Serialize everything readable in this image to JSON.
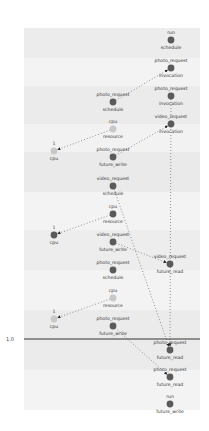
{
  "diagram": {
    "axis": {
      "label": "1.0",
      "y": 339
    },
    "bands": [
      {
        "y": 28,
        "h": 30,
        "color": "#ececec"
      },
      {
        "y": 58,
        "h": 28,
        "color": "#f3f3f3"
      },
      {
        "y": 86,
        "h": 38,
        "color": "#ebebeb"
      },
      {
        "y": 124,
        "h": 28,
        "color": "#f2f2f2"
      },
      {
        "y": 152,
        "h": 40,
        "color": "#eaeaea"
      },
      {
        "y": 192,
        "h": 38,
        "color": "#f3f3f3"
      },
      {
        "y": 230,
        "h": 40,
        "color": "#ededed"
      },
      {
        "y": 270,
        "h": 40,
        "color": "#f3f3f3"
      },
      {
        "y": 310,
        "h": 60,
        "color": "#ebebeb"
      },
      {
        "y": 370,
        "h": 40,
        "color": "#f3f3f3"
      }
    ],
    "nodes": [
      {
        "id": "n1",
        "top": "run",
        "bottom": "schedule",
        "x": 171,
        "y": 40,
        "kind": "dark"
      },
      {
        "id": "n2",
        "top": "photo_request",
        "bottom": "invocation",
        "x": 171,
        "y": 68,
        "kind": "dark"
      },
      {
        "id": "n3",
        "top": "photo_request",
        "bottom": "invocation",
        "x": 171,
        "y": 96,
        "kind": "dark"
      },
      {
        "id": "n4",
        "top": "photo_request",
        "bottom": "schedule",
        "x": 113,
        "y": 102,
        "kind": "dark"
      },
      {
        "id": "n5",
        "top": "video_request",
        "bottom": "invocation",
        "x": 171,
        "y": 124,
        "kind": "dark"
      },
      {
        "id": "n6",
        "top": "cpu",
        "bottom": "resource",
        "x": 113,
        "y": 129,
        "kind": "light"
      },
      {
        "id": "n7",
        "top": "1",
        "bottom": "cpu",
        "x": 54,
        "y": 151,
        "kind": "light"
      },
      {
        "id": "n8",
        "top": "photo_request",
        "bottom": "future_write",
        "x": 113,
        "y": 157,
        "kind": "dark"
      },
      {
        "id": "n9",
        "top": "video_request",
        "bottom": "schedule",
        "x": 113,
        "y": 186,
        "kind": "dark"
      },
      {
        "id": "n10",
        "top": "cpu",
        "bottom": "resource",
        "x": 113,
        "y": 214,
        "kind": "dark"
      },
      {
        "id": "n11",
        "top": "1",
        "bottom": "cpu",
        "x": 54,
        "y": 235,
        "kind": "dark"
      },
      {
        "id": "n12",
        "top": "video_request",
        "bottom": "future_write",
        "x": 113,
        "y": 242,
        "kind": "dark"
      },
      {
        "id": "n13",
        "top": "video_request",
        "bottom": "future_read",
        "x": 170,
        "y": 264,
        "kind": "dark"
      },
      {
        "id": "n14",
        "top": "photo_request",
        "bottom": "schedule",
        "x": 113,
        "y": 270,
        "kind": "dark"
      },
      {
        "id": "n15",
        "top": "cpu",
        "bottom": "resource",
        "x": 113,
        "y": 298,
        "kind": "light"
      },
      {
        "id": "n16",
        "top": "1",
        "bottom": "cpu",
        "x": 54,
        "y": 319,
        "kind": "light"
      },
      {
        "id": "n17",
        "top": "photo_request",
        "bottom": "future_write",
        "x": 113,
        "y": 326,
        "kind": "dark"
      },
      {
        "id": "n18",
        "top": "photo_request",
        "bottom": "future_read",
        "x": 170,
        "y": 350,
        "kind": "dark"
      },
      {
        "id": "n19",
        "top": "photo_request",
        "bottom": "future_read",
        "x": 170,
        "y": 377,
        "kind": "dark"
      },
      {
        "id": "n20",
        "top": "run",
        "bottom": "future_write",
        "x": 170,
        "y": 404,
        "kind": "dark"
      }
    ],
    "edges": [
      {
        "from": "n4",
        "to": "n2"
      },
      {
        "from": "n6",
        "to": "n7"
      },
      {
        "from": "n8",
        "to": "n5"
      },
      {
        "from": "n9",
        "to": "n18"
      },
      {
        "from": "n10",
        "to": "n11"
      },
      {
        "from": "n12",
        "to": "n13"
      },
      {
        "from": "n15",
        "to": "n16"
      },
      {
        "from": "n17",
        "to": "n19"
      },
      {
        "from": "n3",
        "to": "n18"
      }
    ]
  }
}
